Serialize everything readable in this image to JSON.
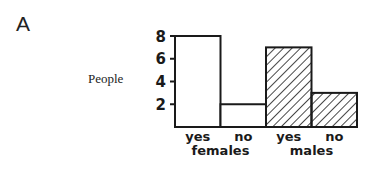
{
  "panel_label": "A",
  "chart_data": {
    "type": "bar",
    "title": "",
    "xlabel": "",
    "ylabel": "People",
    "ylim": [
      0,
      8
    ],
    "yticks": [
      2,
      4,
      6,
      8
    ],
    "grid": false,
    "groups": [
      {
        "name": "females",
        "categories": [
          "yes",
          "no"
        ],
        "values": [
          8,
          2
        ],
        "fill": "white"
      },
      {
        "name": "males",
        "categories": [
          "yes",
          "no"
        ],
        "values": [
          7,
          3
        ],
        "fill": "hatched"
      }
    ],
    "categories": [
      "yes",
      "no",
      "yes",
      "no"
    ],
    "values": [
      8,
      2,
      7,
      3
    ],
    "group_labels": [
      "females",
      "males"
    ]
  }
}
